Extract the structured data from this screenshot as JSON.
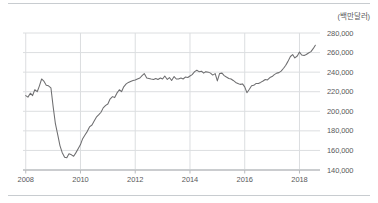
{
  "chart_data": {
    "type": "line",
    "title": "",
    "subtitle": "",
    "xlabel": "",
    "ylabel": "",
    "unit_label": "(백만달러)",
    "xlim": [
      2007.9,
      2018.75
    ],
    "ylim": [
      140000,
      285000
    ],
    "grid": true,
    "legend": false,
    "legend_position": "none",
    "line_color": "#6e6e70",
    "grid_color": "#dcdee0",
    "axis_color": "#b9bcbf",
    "text_color": "#59595b",
    "ytick_labels": [
      "280,000",
      "260,000",
      "240,000",
      "220,000",
      "200,000",
      "180,000",
      "160,000",
      "140,000"
    ],
    "ytick_values": [
      280000,
      260000,
      240000,
      220000,
      200000,
      180000,
      160000,
      140000
    ],
    "xtick_labels": [
      "2008",
      "2010",
      "2012",
      "2014",
      "2016",
      "2018"
    ],
    "xtick_values": [
      2008,
      2010,
      2012,
      2014,
      2016,
      2018
    ],
    "series": [
      {
        "name": "",
        "x": [
          2008.0,
          2008.08,
          2008.17,
          2008.25,
          2008.33,
          2008.42,
          2008.5,
          2008.58,
          2008.67,
          2008.75,
          2008.83,
          2008.92,
          2009.0,
          2009.08,
          2009.17,
          2009.25,
          2009.33,
          2009.42,
          2009.5,
          2009.58,
          2009.67,
          2009.75,
          2009.83,
          2009.92,
          2010.0,
          2010.08,
          2010.17,
          2010.25,
          2010.33,
          2010.42,
          2010.5,
          2010.58,
          2010.67,
          2010.75,
          2010.83,
          2010.92,
          2011.0,
          2011.08,
          2011.17,
          2011.25,
          2011.33,
          2011.42,
          2011.5,
          2011.58,
          2011.67,
          2011.75,
          2011.83,
          2011.92,
          2012.0,
          2012.08,
          2012.17,
          2012.25,
          2012.33,
          2012.42,
          2012.5,
          2012.58,
          2012.67,
          2012.75,
          2012.83,
          2012.92,
          2013.0,
          2013.08,
          2013.17,
          2013.25,
          2013.33,
          2013.42,
          2013.5,
          2013.58,
          2013.67,
          2013.75,
          2013.83,
          2013.92,
          2014.0,
          2014.08,
          2014.17,
          2014.25,
          2014.33,
          2014.42,
          2014.5,
          2014.58,
          2014.67,
          2014.75,
          2014.83,
          2014.92,
          2015.0,
          2015.08,
          2015.17,
          2015.25,
          2015.33,
          2015.42,
          2015.5,
          2015.58,
          2015.67,
          2015.75,
          2015.83,
          2015.92,
          2016.0,
          2016.08,
          2016.17,
          2016.25,
          2016.33,
          2016.42,
          2016.5,
          2016.58,
          2016.67,
          2016.75,
          2016.83,
          2016.92,
          2017.0,
          2017.08,
          2017.17,
          2017.25,
          2017.33,
          2017.42,
          2017.5,
          2017.58,
          2017.67,
          2017.75,
          2017.83,
          2017.92,
          2018.0,
          2018.08,
          2018.17,
          2018.25,
          2018.33,
          2018.42,
          2018.5,
          2018.58
        ],
        "values": [
          216000,
          214500,
          218500,
          216000,
          222000,
          220000,
          226000,
          233000,
          230500,
          226500,
          226000,
          224000,
          205000,
          188000,
          176000,
          165000,
          158000,
          153000,
          152500,
          156500,
          155500,
          154000,
          157500,
          162000,
          166000,
          172000,
          176000,
          179500,
          184000,
          186000,
          190000,
          194000,
          196500,
          199000,
          203500,
          206000,
          207500,
          212500,
          215000,
          214000,
          218500,
          222000,
          220000,
          225000,
          228000,
          229500,
          230500,
          231500,
          232000,
          233000,
          234000,
          236500,
          238500,
          234000,
          233500,
          233000,
          232500,
          233500,
          232500,
          234000,
          233000,
          236000,
          232500,
          234500,
          231500,
          235500,
          233000,
          233000,
          234000,
          233000,
          235000,
          234500,
          236000,
          237500,
          240500,
          242000,
          240500,
          241000,
          239000,
          240500,
          240000,
          239000,
          237000,
          238500,
          231000,
          238500,
          239000,
          236500,
          235000,
          233500,
          233000,
          231500,
          229500,
          228500,
          227500,
          228000,
          225000,
          219000,
          222500,
          226000,
          226500,
          228500,
          228500,
          229500,
          231000,
          232500,
          232000,
          234500,
          235500,
          237500,
          239000,
          239500,
          241000,
          244000,
          247000,
          251000,
          256000,
          258000,
          254500,
          256500,
          260500,
          257500,
          257000,
          258000,
          259500,
          261000,
          264000,
          267500
        ]
      }
    ]
  }
}
